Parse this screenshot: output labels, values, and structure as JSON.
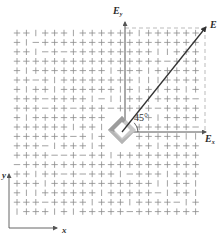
{
  "figure": {
    "vectors": {
      "E": {
        "label": "E",
        "angle_deg": 45
      },
      "Ex": {
        "label_main": "E",
        "label_sub": "x"
      },
      "Ey": {
        "label_main": "E",
        "label_sub": "y"
      }
    },
    "angle_label": "45°",
    "axes": {
      "x_label": "x",
      "y_label": "y"
    },
    "colors": {
      "ink": "#333333",
      "grid_mark": "#8a8a8a",
      "polarizer_dark": "#9a9a9a",
      "polarizer_light": "#cfcfcf",
      "dashed": "#aaaaaa"
    },
    "grid": {
      "cols": 20,
      "rows": 20,
      "x_start": 17,
      "y_start": 33,
      "spacing": 9.4
    }
  }
}
